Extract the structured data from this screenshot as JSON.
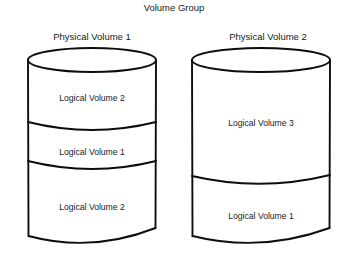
{
  "diagram": {
    "title": "Volume Group",
    "background_color": "#ffffff",
    "stroke_color": "#0d0d0d",
    "text_color": "#1a1a1a",
    "physical_volumes": [
      {
        "label": "Physical Volume 1",
        "segments": [
          {
            "label": "Logical Volume 2"
          },
          {
            "label": "Logical Volume 1"
          },
          {
            "label": "Logical Volume 2"
          }
        ]
      },
      {
        "label": "Physical Volume 2",
        "segments": [
          {
            "label": "Logical Volume 3"
          },
          {
            "label": "Logical Volume 1"
          }
        ]
      }
    ]
  }
}
